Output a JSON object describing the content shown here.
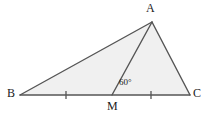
{
  "figure": {
    "type": "geometry-diagram",
    "shape": "triangle-with-median",
    "background_color": "#ffffff",
    "fill_color": "#f0f0f0",
    "stroke_color": "#555555",
    "stroke_width": 1.4,
    "width": 213,
    "height": 116,
    "points": {
      "A": {
        "x": 152,
        "y": 22
      },
      "B": {
        "x": 20,
        "y": 95
      },
      "C": {
        "x": 190,
        "y": 95
      },
      "M": {
        "x": 112,
        "y": 95
      }
    },
    "polygon_path": "M 20,95 L 152,22 L 190,95 Z",
    "segments": [
      {
        "name": "AB",
        "from": "A",
        "to": "B"
      },
      {
        "name": "AC",
        "from": "A",
        "to": "C"
      },
      {
        "name": "BC",
        "from": "B",
        "to": "C"
      },
      {
        "name": "AM",
        "from": "A",
        "to": "M"
      }
    ],
    "tick_marks": [
      {
        "name": "tick-BM",
        "x": 66,
        "y": 95,
        "segment": "BM"
      },
      {
        "name": "tick-MC",
        "x": 151,
        "y": 95,
        "segment": "MC"
      }
    ],
    "tick_half_height": 4
  },
  "labels": {
    "A": "A",
    "B": "B",
    "M": "M",
    "C": "C",
    "angle_at_M": "60°"
  }
}
